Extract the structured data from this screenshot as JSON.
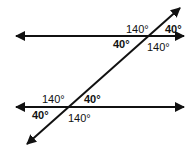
{
  "diagram": {
    "top_intersection": {
      "upper_left": "140°",
      "upper_right": "40°",
      "lower_left": "40°",
      "lower_right": "140°"
    },
    "bottom_intersection": {
      "upper_left": "140°",
      "upper_right": "40°",
      "lower_left": "40°",
      "lower_right": "140°"
    },
    "line_color": "#111111"
  }
}
